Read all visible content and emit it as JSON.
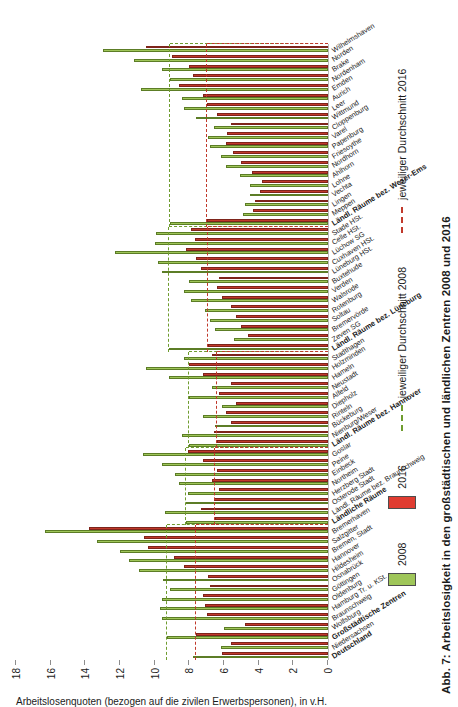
{
  "figure": {
    "caption": "Abb. 7: Arbeitslosigkeit in den großstädtischen und ländlichen Zentren 2008 und 2016",
    "axis_title": "Arbeitslosenquoten (bezogen auf die zivilen Erwerbspersonen), in v.H."
  },
  "legend": {
    "entries": [
      {
        "label": "2008",
        "type": "swatch",
        "color": "#9fc659"
      },
      {
        "label": "2016",
        "type": "swatch",
        "color": "#e03c31"
      },
      {
        "label": "jeweiliger Durchschnitt 2008",
        "type": "dash",
        "color": "#6f9c2f"
      },
      {
        "label": "jeweiliger Durchschnitt 2016",
        "type": "dash",
        "color": "#c0392b"
      }
    ]
  },
  "chart_data": {
    "type": "bar",
    "title": "Abb. 7: Arbeitslosigkeit in den großstädtischen und ländlichen Zentren 2008 und 2016",
    "xlabel": "",
    "ylabel": "Arbeitslosenquoten (bezogen auf die zivilen Erwerbspersonen), in v.H.",
    "ylim": [
      0,
      18
    ],
    "yticks": [
      0,
      2,
      4,
      6,
      8,
      10,
      12,
      14,
      16,
      18
    ],
    "grid": false,
    "orientation": "horizontal-bars-rotated",
    "legend_position": "bottom",
    "series": [
      {
        "name": "2008",
        "color": "#9fc659"
      },
      {
        "name": "2016",
        "color": "#c0392b"
      }
    ],
    "groups": [
      {
        "name": "Großstädtische Zentren",
        "average_2008": 9.3,
        "average_2016": 7.6,
        "categories": [
          "Deutschland",
          "Niedersachsen",
          "Großstädtische Zentren",
          "Wolfsburg",
          "Braunschweig",
          "Hamburg Tr. u. KSt.",
          "Oldenburg",
          "Göttingen",
          "Osnabrück",
          "Hildesheim",
          "Hannover",
          "Bremen, Stadt",
          "Salzgitter",
          "Bremerhaven"
        ],
        "values_2008": [
          7.8,
          6.2,
          9.3,
          6.0,
          9.6,
          9.7,
          9.6,
          9.1,
          9.5,
          10.9,
          11.5,
          12.0,
          13.3,
          16.3
        ],
        "values_2016": [
          6.1,
          5.6,
          7.6,
          4.8,
          7.0,
          7.1,
          7.2,
          6.8,
          6.9,
          8.3,
          8.9,
          10.4,
          10.6,
          13.8
        ]
      },
      {
        "name": "Ländliche Räume",
        "average_2008": 8.2,
        "average_2016": 6.5,
        "categories": [
          "Ländliche Räume",
          "Ländl. Räume bez. Braunschweig",
          "Osterode Stadt",
          "Herzberg Stadt",
          "Northeim",
          "Einbeck",
          "Peine",
          "Goslar"
        ],
        "values_2008": [
          8.2,
          9.4,
          8.2,
          8.1,
          8.6,
          8.8,
          9.6,
          10.7
        ],
        "values_2016": [
          6.5,
          7.3,
          6.6,
          6.3,
          6.7,
          6.4,
          7.2,
          8.1
        ]
      },
      {
        "name": "Ländl. Räume bez. Hannover",
        "average_2008": 8.0,
        "average_2016": 6.4,
        "categories": [
          "Ländl. Räume bez. Hannover",
          "Nienburg/Weser",
          "Bückeburg",
          "Rinteln",
          "Diepholz",
          "Alfeld",
          "Neustadt",
          "Hameln",
          "Holzminden",
          "Stadthagen"
        ],
        "values_2008": [
          8.0,
          8.4,
          6.5,
          7.2,
          6.1,
          8.0,
          6.7,
          9.2,
          10.5,
          8.3
        ],
        "values_2016": [
          6.4,
          6.6,
          5.6,
          5.9,
          5.3,
          6.3,
          5.6,
          7.2,
          8.0,
          6.7
        ]
      },
      {
        "name": "Ländl. Räume bez. Lüneburg",
        "average_2008": 9.2,
        "average_2016": 6.9,
        "categories": [
          "Ländl. Räume bez. Lüneburg",
          "Zeven SG",
          "Bremervörde",
          "Soltau",
          "Rotenburg",
          "Walsrode",
          "Verden",
          "Buxtehude",
          "Lüneburg HSt.",
          "Cuxhaven HSt.",
          "Lüchow SG",
          "Celle HSt.",
          "Stade HSt."
        ],
        "values_2008": [
          9.2,
          5.4,
          6.5,
          6.8,
          7.1,
          7.9,
          8.3,
          8.0,
          9.6,
          9.8,
          12.3,
          10.0,
          9.9
        ],
        "values_2016": [
          6.9,
          4.6,
          5.0,
          5.3,
          5.6,
          6.1,
          6.4,
          6.3,
          7.3,
          7.6,
          8.2,
          7.7,
          7.9
        ]
      },
      {
        "name": "Ländl. Räume bez. Weser-Ems",
        "average_2008": 9.1,
        "average_2016": 7.0,
        "categories": [
          "Ländl. Räume bez. Weser-Ems",
          "Meppen",
          "Lingen",
          "Vechta",
          "Lohne",
          "Ahlhorn",
          "Nordhorn",
          "Friesoythe",
          "Papenburg",
          "Varel",
          "Cloppenburg",
          "Wittmund",
          "Leer",
          "Aurich",
          "Emden",
          "Nordenham",
          "Brake",
          "Norden",
          "Wilhelmshaven"
        ],
        "values_2008": [
          9.1,
          4.9,
          4.8,
          4.5,
          4.5,
          5.1,
          5.9,
          6.2,
          6.8,
          6.9,
          6.6,
          7.6,
          8.3,
          8.4,
          10.8,
          9.1,
          9.6,
          11.2,
          13.0
        ],
        "values_2016": [
          7.0,
          4.3,
          4.2,
          3.9,
          3.8,
          4.4,
          5.0,
          5.5,
          5.9,
          5.8,
          5.6,
          6.4,
          7.0,
          7.2,
          8.6,
          7.8,
          8.0,
          9.0,
          10.5
        ]
      }
    ]
  },
  "axis": {
    "ticks": [
      "0",
      "2",
      "4",
      "6",
      "8",
      "10",
      "12",
      "14",
      "16",
      "18"
    ]
  }
}
